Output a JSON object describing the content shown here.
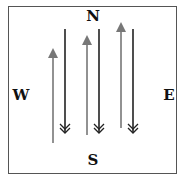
{
  "diagram": {
    "compass": {
      "north": "N",
      "south": "S",
      "west": "W",
      "east": "E"
    },
    "colors": {
      "up_arrow": "#777777",
      "down_arrow": "#222222",
      "border": "#555555"
    },
    "up_arrows": [
      {
        "x": 53,
        "top": 48,
        "bottom": 143
      },
      {
        "x": 87,
        "top": 35,
        "bottom": 135
      },
      {
        "x": 121,
        "top": 22,
        "bottom": 128
      }
    ],
    "down_arrows": [
      {
        "x": 65,
        "top": 29,
        "bottom": 132
      },
      {
        "x": 99,
        "top": 29,
        "bottom": 132
      },
      {
        "x": 133,
        "top": 29,
        "bottom": 132
      }
    ]
  }
}
